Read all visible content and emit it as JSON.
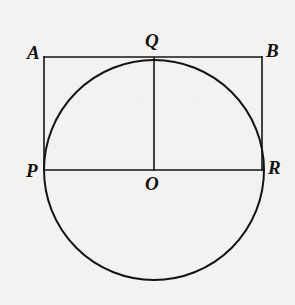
{
  "figure": {
    "background_color": "#f3f2f0",
    "stroke_color": "#141414",
    "label_color": "#121212",
    "canvas": {
      "width": 295,
      "height": 305
    }
  },
  "geometry": {
    "circle": {
      "name": "main-circle",
      "center": {
        "x": 154,
        "y": 170
      },
      "radius": 110,
      "stroke_width": 2.0
    },
    "rectangle": {
      "name": "rectangle-ABRP",
      "left": 44,
      "right": 262,
      "top": 57,
      "bottom": 170,
      "stroke_width": 1.6
    },
    "segments": [
      {
        "name": "segment-AB",
        "x1": 44,
        "y1": 57,
        "x2": 262,
        "y2": 57
      },
      {
        "name": "segment-PR",
        "x1": 44,
        "y1": 170,
        "x2": 264,
        "y2": 170
      },
      {
        "name": "segment-AP",
        "x1": 44,
        "y1": 57,
        "x2": 44,
        "y2": 170
      },
      {
        "name": "segment-BR",
        "x1": 262,
        "y1": 57,
        "x2": 262,
        "y2": 170
      },
      {
        "name": "segment-QO",
        "x1": 154,
        "y1": 58,
        "x2": 154,
        "y2": 170
      }
    ]
  },
  "labels": [
    {
      "name": "label-A",
      "text": "A",
      "x": 27,
      "y": 43,
      "size": 19
    },
    {
      "name": "label-Q",
      "text": "Q",
      "x": 145,
      "y": 31,
      "size": 19
    },
    {
      "name": "label-B",
      "text": "B",
      "x": 266,
      "y": 41,
      "size": 19
    },
    {
      "name": "label-P",
      "text": "P",
      "x": 26,
      "y": 161,
      "size": 19
    },
    {
      "name": "label-O",
      "text": "O",
      "x": 145,
      "y": 174,
      "size": 19
    },
    {
      "name": "label-R",
      "text": "R",
      "x": 268,
      "y": 158,
      "size": 19
    }
  ],
  "points": [
    {
      "name": "point-A",
      "label": "A",
      "x": 44,
      "y": 57,
      "role": "rectangle-top-left"
    },
    {
      "name": "point-B",
      "label": "B",
      "x": 262,
      "y": 57,
      "role": "rectangle-top-right"
    },
    {
      "name": "point-Q",
      "label": "Q",
      "x": 154,
      "y": 58,
      "role": "circle-top-tangent"
    },
    {
      "name": "point-P",
      "label": "P",
      "x": 44,
      "y": 170,
      "role": "circle-left-point"
    },
    {
      "name": "point-R",
      "label": "R",
      "x": 264,
      "y": 170,
      "role": "circle-right-point"
    },
    {
      "name": "point-O",
      "label": "O",
      "x": 154,
      "y": 170,
      "role": "circle-center"
    }
  ]
}
